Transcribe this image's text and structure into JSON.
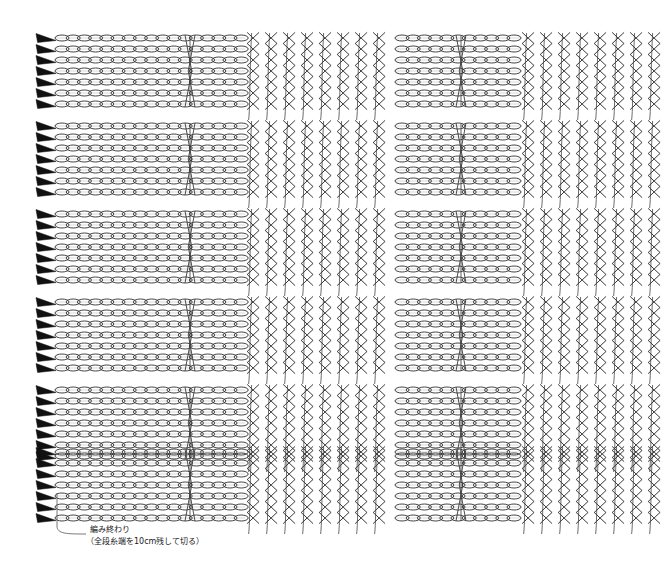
{
  "document": {
    "title": "",
    "background_color": "#ffffff",
    "ink_color": "#3a3a3a",
    "marker_color": "#111111",
    "width": 668,
    "height": 569
  },
  "annotation": {
    "line1": "編み終わり",
    "line2": "（全段糸端を10cm残して切る）",
    "leader": {
      "from_x": 57,
      "from_y": 505,
      "to_x": 86,
      "to_y": 534
    },
    "text_x": 90,
    "text_y": 534
  },
  "chart_data": {
    "type": "diagram",
    "title": "",
    "subtitle": "",
    "xlabel": "",
    "ylabel": "",
    "legend": [],
    "notation": "japanese-crochet-symbol-chart",
    "geometry": {
      "left_margin": 36,
      "stitch_area_left": 55,
      "stitch_area_right": 668,
      "block_count": 6,
      "rows_per_block": 7,
      "row_pitch": 11,
      "block_pitch": 88,
      "first_block_top": 38,
      "arrow_x": 36,
      "arrow_width": 20,
      "arrow_height": 9
    },
    "sections": [
      {
        "name": "chain-band-a",
        "kind": "chain",
        "x_start": 55,
        "x_end": 245,
        "marker_x": 190
      },
      {
        "name": "cross-columns-a",
        "kind": "cross",
        "x_start": 245,
        "x_end": 395,
        "column_pitch": 18
      },
      {
        "name": "chain-band-b",
        "kind": "chain",
        "x_start": 395,
        "x_end": 520,
        "marker_x": 461
      },
      {
        "name": "cross-columns-b",
        "kind": "cross",
        "x_start": 520,
        "x_end": 668,
        "column_pitch": 18
      }
    ],
    "blocks": [
      {
        "index": 1,
        "top": 38,
        "rows": 7,
        "direction": "right"
      },
      {
        "index": 2,
        "top": 126,
        "rows": 7,
        "direction": "right"
      },
      {
        "index": 3,
        "top": 214,
        "rows": 7,
        "direction": "right"
      },
      {
        "index": 4,
        "top": 302,
        "rows": 7,
        "direction": "right"
      },
      {
        "index": 5,
        "top": 390,
        "rows": 7,
        "direction": "right"
      },
      {
        "index": 6,
        "top": 452,
        "rows": 7,
        "direction": "right"
      }
    ],
    "symbols": [
      {
        "name": "chain-stitch",
        "glyph": "oval",
        "meaning": "くさり編み"
      },
      {
        "name": "crossed-double-crochet",
        "glyph": "X",
        "meaning": "交差編み"
      },
      {
        "name": "row-start-arrow",
        "glyph": "solid-triangle",
        "meaning": "段の編み始め"
      },
      {
        "name": "column-marker",
        "glyph": "hourglass",
        "meaning": "模様の区切り"
      }
    ]
  }
}
